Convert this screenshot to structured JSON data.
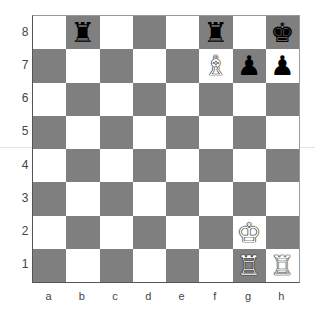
{
  "board": {
    "files": [
      "a",
      "b",
      "c",
      "d",
      "e",
      "f",
      "g",
      "h"
    ],
    "ranks": [
      "8",
      "7",
      "6",
      "5",
      "4",
      "3",
      "2",
      "1"
    ],
    "colors": {
      "light": "#ffffff",
      "dark": "#7f7f7f"
    },
    "pieces": [
      {
        "square": "b8",
        "color": "black",
        "type": "rook",
        "glyph": "♜"
      },
      {
        "square": "f8",
        "color": "black",
        "type": "rook",
        "glyph": "♜"
      },
      {
        "square": "h8",
        "color": "black",
        "type": "king",
        "glyph": "♚"
      },
      {
        "square": "f7",
        "color": "white",
        "type": "bishop",
        "glyph": "♗"
      },
      {
        "square": "g7",
        "color": "black",
        "type": "pawn",
        "glyph": "♟"
      },
      {
        "square": "h7",
        "color": "black",
        "type": "pawn",
        "glyph": "♟"
      },
      {
        "square": "g2",
        "color": "white",
        "type": "king",
        "glyph": "♔"
      },
      {
        "square": "g1",
        "color": "white",
        "type": "rook",
        "glyph": "♖"
      },
      {
        "square": "h1",
        "color": "white",
        "type": "rook",
        "glyph": "♖"
      }
    ]
  }
}
